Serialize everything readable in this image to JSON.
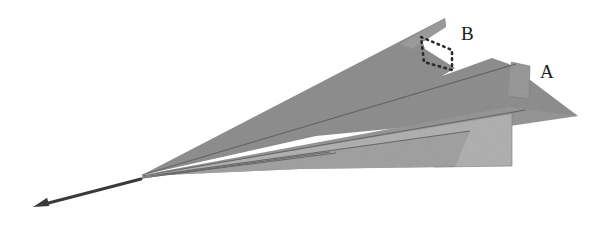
{
  "figure": {
    "background_color": "#ffffff",
    "width": 603,
    "height": 230,
    "palette": {
      "facet_dark": "#909090",
      "facet_mid": "#9a9a9a",
      "facet_light": "#b2b2b2",
      "facet_lighter": "#bcbcbc",
      "fold_line": "#5d5d5d",
      "outline": "#7a7a7a",
      "dotted_outline": "#2b2b2b",
      "arrow_color": "#3a3a3a",
      "label_color": "#1c1c1c"
    },
    "labels": [
      {
        "id": "label-b",
        "text": "B",
        "x": 461,
        "y": 40,
        "font_size": 20,
        "describes": "dotted quadrilateral region on the upper facet"
      },
      {
        "id": "label-a",
        "text": "A",
        "x": 540,
        "y": 78,
        "font_size": 20,
        "describes": "small raised tab on the right edge"
      }
    ],
    "arrow": {
      "id": "direction-arrow",
      "from_x": 141,
      "from_y": 179,
      "to_x": 33,
      "to_y": 207,
      "head_length": 16,
      "head_width": 11,
      "line_width": 3.0,
      "color": "#3a3a3a",
      "meaning": "direction-of-motion indicator pointing down and to the left"
    },
    "apex": {
      "x": 142,
      "y": 175
    },
    "facets": [
      {
        "id": "facet-upper-dark",
        "name": "upper-dark-facet",
        "fill": "#909090",
        "points": "142,175 445,18 446,27 421,37 425,49 455,68 442,76 492,58 509,64 578,116 524,116 316,136"
      },
      {
        "id": "facet-mid-band",
        "name": "mid-band-facet",
        "fill": "#979797",
        "points": "142,175 508,107 578,116 330,152"
      },
      {
        "id": "facet-lower-light",
        "name": "lower-light-facet",
        "fill": "#b2b2b2",
        "points": "142,176 512,114 512,166 432,167 300,169"
      },
      {
        "id": "facet-lowest-sliver",
        "name": "lowest-sliver-facet",
        "fill": "#a3a3a3",
        "points": "142,176 470,131 455,167 300,169"
      },
      {
        "id": "facet-tab-a",
        "name": "tab-a-facet",
        "fill": "#9b9b9b",
        "points": "511,62 530,66 529,99 508,96"
      },
      {
        "id": "facet-top-sliver",
        "name": "top-sliver-facet",
        "fill": "#9d9d9d",
        "points": "400,44 445,18 446,27 412,49"
      }
    ],
    "fold_lines": [
      {
        "id": "fold-1",
        "name": "fold-line-upper",
        "x1": 142,
        "y1": 175,
        "x2": 516,
        "y2": 64
      },
      {
        "id": "fold-2",
        "name": "fold-line-middle",
        "x1": 142,
        "y1": 176,
        "x2": 525,
        "y2": 110
      },
      {
        "id": "fold-3",
        "name": "fold-line-lower",
        "x1": 142,
        "y1": 177,
        "x2": 470,
        "y2": 131
      },
      {
        "id": "fold-4",
        "name": "fold-line-bottom",
        "x1": 142,
        "y1": 178,
        "x2": 330,
        "y2": 152
      }
    ],
    "dotted_region": {
      "id": "dotted-region-b",
      "name": "dotted-quadrilateral-b",
      "points": "421,37 452,50 452,70 424,62",
      "stroke": "#2b2b2b",
      "stroke_width": 2.6,
      "dash": "1.5 4.5"
    }
  }
}
